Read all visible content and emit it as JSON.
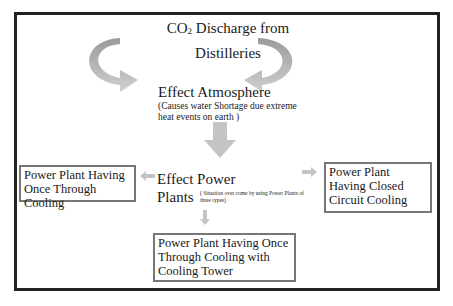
{
  "diagram": {
    "title": {
      "line1_pre": "CO",
      "line1_sub": "2",
      "line1_post": " Discharge from",
      "line2": "Distilleries"
    },
    "atmosphere": {
      "label": "Effect Atmosphere",
      "note": "(Causes water Shortage due extreme heat events on earth )"
    },
    "power": {
      "line1": "Effect Power",
      "line2": "Plants",
      "note": "( Situation over come by using Power Plants of three types)"
    },
    "boxes": {
      "left": "Power Plant Having Once Through Cooling",
      "right": "Power Plant Having Closed Circuit Cooling",
      "bottom": "Power Plant Having Once Through Cooling with Cooling Tower"
    },
    "colors": {
      "arrow_dark": "#9a9a9a",
      "arrow_light": "#c8c8c8",
      "border": "#222222",
      "box_border": "#777777"
    }
  }
}
